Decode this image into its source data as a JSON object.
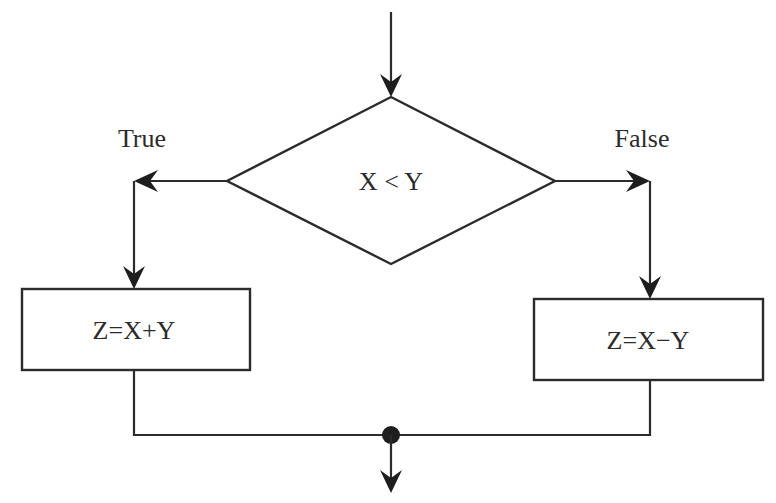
{
  "diagram": {
    "type": "flowchart",
    "decision": {
      "label": "X < Y"
    },
    "branches": {
      "true": {
        "label": "True",
        "process": "Z=X+Y"
      },
      "false": {
        "label": "False",
        "process": "Z=X−Y"
      }
    },
    "merge": {
      "symbol": "junction-dot"
    },
    "colors": {
      "stroke": "#2b2b2b",
      "background": "#ffffff"
    }
  }
}
